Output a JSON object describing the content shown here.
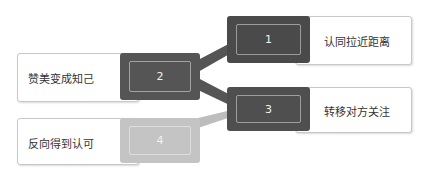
{
  "diagram": {
    "nodes": [
      {
        "id": 1,
        "number": "1",
        "label": "认同拉近距离",
        "color": "#4a4a4a"
      },
      {
        "id": 2,
        "number": "2",
        "label": "赞美变成知己",
        "color": "#555555"
      },
      {
        "id": 3,
        "number": "3",
        "label": "转移对方关注",
        "color": "#4f4f4f"
      },
      {
        "id": 4,
        "number": "4",
        "label": "反向得到认可",
        "color": "#c4c4c4"
      }
    ],
    "edges": [
      {
        "from": 2,
        "to": 1
      },
      {
        "from": 2,
        "to": 3
      },
      {
        "from": 4,
        "to": 3
      }
    ]
  }
}
